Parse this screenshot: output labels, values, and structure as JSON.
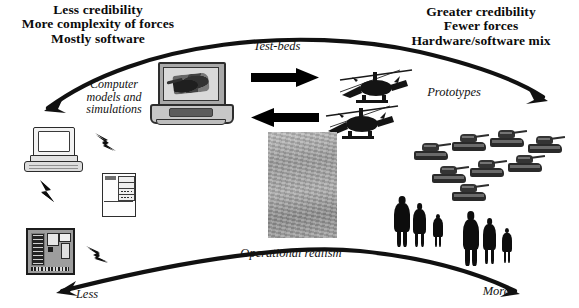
{
  "diagram": {
    "title_left": "Less credibility\nMore complexity of forces\nMostly software",
    "title_right": "Greater credibility\nFewer forces\nHardware/software mix",
    "labels": {
      "test_beds": "Test-beds",
      "computer_models": "Computer\nmodels and\nsimulations",
      "prototypes": "Prototypes",
      "operational_realism": "Operational realism",
      "less": "Less",
      "more": "More"
    },
    "colors": {
      "ink": "#0b0b0b",
      "background": "#ffffff",
      "photo_gray": "#9e9e9e",
      "silhouette": "#0d0d0d"
    },
    "icons": {
      "desktop_computer": "desktop-computer-icon",
      "laptop": "laptop-icon",
      "server_cabinet": "server-cabinet-icon",
      "mainframe": "mainframe-icon",
      "battlefield_photo": "battlefield-photo",
      "helicopter": "helicopter-icon",
      "tank": "tank-icon",
      "soldier": "soldier-icon",
      "lightning": "lightning-bolt-icon",
      "arrow_right": "arrow-right-icon",
      "arrow_left": "arrow-left-icon",
      "top_curve_arrow": "curved-arrow-right-icon",
      "bottom_curve_arrow": "curved-arrow-left-icon"
    }
  }
}
